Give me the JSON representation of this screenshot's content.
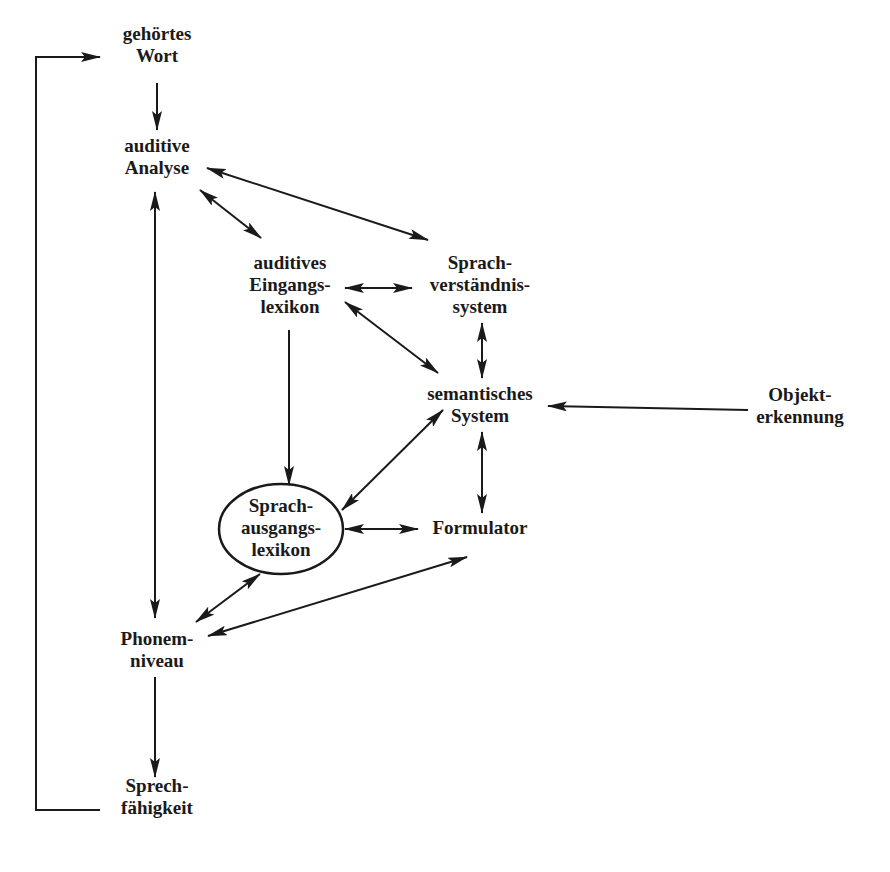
{
  "diagram": {
    "type": "flow-model",
    "nodes": [
      {
        "id": "gehoertes_wort",
        "lines": [
          "gehörtes",
          "Wort"
        ],
        "x": 157,
        "y": 45
      },
      {
        "id": "auditive_analyse",
        "lines": [
          "auditive",
          "Analyse"
        ],
        "x": 157,
        "y": 155
      },
      {
        "id": "auditives_eingangslexikon",
        "lines": [
          "auditives",
          "Eingangs-",
          "lexikon"
        ],
        "x": 290,
        "y": 285
      },
      {
        "id": "sprachverstaendnissystem",
        "lines": [
          "Sprach-",
          "verständnis-",
          "system"
        ],
        "x": 480,
        "y": 285
      },
      {
        "id": "semantisches_system",
        "lines": [
          "semantisches",
          "System"
        ],
        "x": 480,
        "y": 405
      },
      {
        "id": "objekterkennung",
        "lines": [
          "Objekt-",
          "erkennung"
        ],
        "x": 800,
        "y": 405
      },
      {
        "id": "sprachausgangslexikon",
        "lines": [
          "Sprach-",
          "ausgangs-",
          "lexikon"
        ],
        "x": 281,
        "y": 528,
        "shape": "ellipse"
      },
      {
        "id": "formulator",
        "lines": [
          "Formulator"
        ],
        "x": 480,
        "y": 528
      },
      {
        "id": "phonemniveau",
        "lines": [
          "Phonem-",
          "niveau"
        ],
        "x": 157,
        "y": 650
      },
      {
        "id": "sprechfaehigkeit",
        "lines": [
          "Sprech-",
          "fähigkeit"
        ],
        "x": 157,
        "y": 795
      }
    ],
    "edges": [
      {
        "from": "gehoertes_wort",
        "to": "auditive_analyse",
        "direction": "forward"
      },
      {
        "from": "auditive_analyse",
        "to": "sprachverstaendnissystem",
        "direction": "both"
      },
      {
        "from": "auditive_analyse",
        "to": "auditives_eingangslexikon",
        "direction": "both"
      },
      {
        "from": "auditive_analyse",
        "to": "phonemniveau",
        "direction": "both"
      },
      {
        "from": "auditives_eingangslexikon",
        "to": "sprachverstaendnissystem",
        "direction": "both"
      },
      {
        "from": "auditives_eingangslexikon",
        "to": "semantisches_system",
        "direction": "both"
      },
      {
        "from": "auditives_eingangslexikon",
        "to": "sprachausgangslexikon",
        "direction": "forward"
      },
      {
        "from": "sprachverstaendnissystem",
        "to": "semantisches_system",
        "direction": "both"
      },
      {
        "from": "objekterkennung",
        "to": "semantisches_system",
        "direction": "forward"
      },
      {
        "from": "semantisches_system",
        "to": "sprachausgangslexikon",
        "direction": "both"
      },
      {
        "from": "semantisches_system",
        "to": "formulator",
        "direction": "both"
      },
      {
        "from": "sprachausgangslexikon",
        "to": "formulator",
        "direction": "both"
      },
      {
        "from": "sprachausgangslexikon",
        "to": "phonemniveau",
        "direction": "both"
      },
      {
        "from": "phonemniveau",
        "to": "formulator",
        "direction": "both"
      },
      {
        "from": "phonemniveau",
        "to": "sprechfaehigkeit",
        "direction": "forward"
      },
      {
        "from": "sprechfaehigkeit",
        "to": "gehoertes_wort",
        "direction": "forward",
        "route": "feedback-loop-left"
      }
    ]
  },
  "labels": {
    "gehoertes_wort": [
      "gehörtes",
      "Wort"
    ],
    "auditive_analyse": [
      "auditive",
      "Analyse"
    ],
    "auditives_eingangslexikon": [
      "auditives",
      "Eingangs-",
      "lexikon"
    ],
    "sprachverstaendnissystem": [
      "Sprach-",
      "verständnis-",
      "system"
    ],
    "semantisches_system": [
      "semantisches",
      "System"
    ],
    "objekterkennung": [
      "Objekt-",
      "erkennung"
    ],
    "sprachausgangslexikon": [
      "Sprach-",
      "ausgangs-",
      "lexikon"
    ],
    "formulator": [
      "Formulator"
    ],
    "phonemniveau": [
      "Phonem-",
      "niveau"
    ],
    "sprechfaehigkeit": [
      "Sprech-",
      "fähigkeit"
    ]
  },
  "colors": {
    "ink": "#1a1a1a",
    "background": "#ffffff"
  }
}
